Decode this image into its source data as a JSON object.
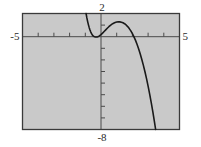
{
  "chart_data": {
    "type": "line",
    "title": "",
    "xlabel": "",
    "ylabel": "",
    "xlim": [
      -5,
      5
    ],
    "ylim": [
      -8,
      2
    ],
    "grid": false,
    "legend": null,
    "axis_labels": {
      "x_min": "-5",
      "x_max": "5",
      "y_max": "2",
      "y_min": "-8"
    },
    "x_tick_interval": 1,
    "y_tick_interval": 1,
    "x_ticks": [
      -5,
      -4,
      -3,
      -2,
      -1,
      0,
      1,
      2,
      3,
      4,
      5
    ],
    "y_ticks": [
      -8,
      -7,
      -6,
      -5,
      -4,
      -3,
      -2,
      -1,
      0,
      1,
      2
    ],
    "series": [
      {
        "name": "curve",
        "color": "#1a1a1a",
        "points": [
          [
            -0.95,
            2.0
          ],
          [
            -0.9,
            1.62
          ],
          [
            -0.85,
            1.3
          ],
          [
            -0.8,
            1.02
          ],
          [
            -0.75,
            0.78
          ],
          [
            -0.7,
            0.57
          ],
          [
            -0.65,
            0.4
          ],
          [
            -0.6,
            0.26
          ],
          [
            -0.55,
            0.15
          ],
          [
            -0.5,
            0.07
          ],
          [
            -0.45,
            0.02
          ],
          [
            -0.4,
            -0.01
          ],
          [
            -0.35,
            -0.03
          ],
          [
            -0.3,
            -0.03
          ],
          [
            -0.25,
            -0.02
          ],
          [
            -0.2,
            0.0
          ],
          [
            -0.1,
            0.07
          ],
          [
            0.0,
            0.18
          ],
          [
            0.1,
            0.31
          ],
          [
            0.2,
            0.45
          ],
          [
            0.3,
            0.59
          ],
          [
            0.4,
            0.73
          ],
          [
            0.5,
            0.86
          ],
          [
            0.6,
            0.98
          ],
          [
            0.7,
            1.08
          ],
          [
            0.8,
            1.16
          ],
          [
            0.9,
            1.22
          ],
          [
            1.0,
            1.26
          ],
          [
            1.1,
            1.28
          ],
          [
            1.2,
            1.28
          ],
          [
            1.3,
            1.25
          ],
          [
            1.4,
            1.2
          ],
          [
            1.5,
            1.12
          ],
          [
            1.6,
            1.01
          ],
          [
            1.7,
            0.87
          ],
          [
            1.8,
            0.7
          ],
          [
            1.9,
            0.5
          ],
          [
            2.0,
            0.26
          ],
          [
            2.1,
            -0.01
          ],
          [
            2.2,
            -0.32
          ],
          [
            2.3,
            -0.67
          ],
          [
            2.4,
            -1.06
          ],
          [
            2.5,
            -1.49
          ],
          [
            2.6,
            -1.96
          ],
          [
            2.7,
            -2.47
          ],
          [
            2.8,
            -3.02
          ],
          [
            2.9,
            -3.62
          ],
          [
            3.0,
            -4.26
          ],
          [
            3.1,
            -4.95
          ],
          [
            3.2,
            -5.68
          ],
          [
            3.3,
            -6.46
          ],
          [
            3.4,
            -7.29
          ],
          [
            3.48,
            -8.0
          ]
        ]
      }
    ],
    "frame": {
      "background": "#c9c9c9",
      "border_color": "#3a3a3a",
      "axis_color": "#4a4a4a"
    }
  },
  "labels": {
    "y_max": "2",
    "y_min": "-8",
    "x_min": "-5",
    "x_max": "5"
  }
}
